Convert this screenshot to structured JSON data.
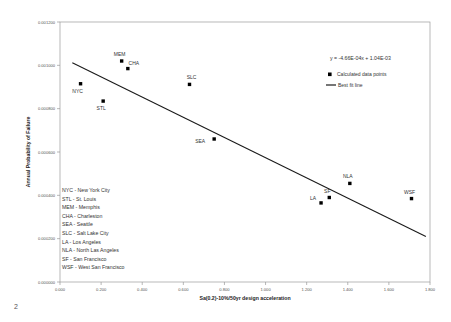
{
  "page": {
    "page_number": "2"
  },
  "chart_data": {
    "type": "scatter",
    "title": "",
    "xlabel": "Sa(0.2)-10%/50yr design acceleration",
    "ylabel": "Annual Probability of Failure",
    "xlim": [
      0.0,
      1.8
    ],
    "ylim": [
      0.0,
      0.0012
    ],
    "xticks": [
      "0.000",
      "0.200",
      "0.400",
      "0.600",
      "0.800",
      "1.000",
      "1.200",
      "1.400",
      "1.600",
      "1.800"
    ],
    "xtick_values": [
      0.0,
      0.2,
      0.4,
      0.6,
      0.8,
      1.0,
      1.2,
      1.4,
      1.6,
      1.8
    ],
    "yticks": [
      "0.000000",
      "0.000200",
      "0.000400",
      "0.000600",
      "0.000800",
      "0.001000",
      "0.001200"
    ],
    "ytick_values": [
      0.0,
      0.0002,
      0.0004,
      0.0006,
      0.0008,
      0.001,
      0.0012
    ],
    "grid": false,
    "legend_position": "top-right",
    "points": [
      {
        "label": "NYC",
        "x": 0.1,
        "y": 0.000915,
        "label_dx": -3,
        "label_dy": 9
      },
      {
        "label": "STL",
        "x": 0.21,
        "y": 0.000835,
        "label_dx": -2,
        "label_dy": 9
      },
      {
        "label": "MEM",
        "x": 0.3,
        "y": 0.00102,
        "label_dx": -2,
        "label_dy": -5
      },
      {
        "label": "CHA",
        "x": 0.33,
        "y": 0.000985,
        "label_dx": 6,
        "label_dy": -4
      },
      {
        "label": "SLC",
        "x": 0.63,
        "y": 0.000912,
        "label_dx": 2,
        "label_dy": -5
      },
      {
        "label": "SEA",
        "x": 0.75,
        "y": 0.00066,
        "label_dx": -14,
        "label_dy": 4
      },
      {
        "label": "LA",
        "x": 1.27,
        "y": 0.000365,
        "label_dx": -8,
        "label_dy": -3
      },
      {
        "label": "SF",
        "x": 1.31,
        "y": 0.00039,
        "label_dx": -2,
        "label_dy": -5
      },
      {
        "label": "NLA",
        "x": 1.41,
        "y": 0.000455,
        "label_dx": -2,
        "label_dy": -5
      },
      {
        "label": "WSF",
        "x": 1.71,
        "y": 0.000385,
        "label_dx": -2,
        "label_dy": -5
      }
    ],
    "best_fit": {
      "slope": -0.000466,
      "intercept": 0.00104,
      "x_start": 0.06,
      "x_end": 1.78,
      "equation": "y = -4.66E-04x + 1.04E-03"
    },
    "legend": {
      "equation": "y = -4.66E-04x + 1.04E-03",
      "items": [
        {
          "label": "Calculated data points",
          "marker": "square",
          "color": "#000000"
        },
        {
          "label": "Best fit line",
          "marker": "line",
          "color": "#1a1a1a"
        }
      ]
    },
    "abbreviations": [
      "NYC - New York City",
      "STL  - St. Louis",
      "MEM - Memphis",
      "CHA - Charleston",
      "SEA - Seattle",
      "SLC - Salt Lake City",
      "LA - Los Angeles",
      "NLA - North Las Angeles",
      "SF - San Francisco",
      "WSF - West San Francisco"
    ],
    "colors": {
      "marker": "#000000",
      "line": "#1a1a1a",
      "axis": "#9a9a9a",
      "text": "#333333"
    }
  }
}
